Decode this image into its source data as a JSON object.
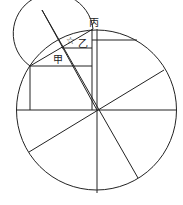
{
  "diagram": {
    "labels": {
      "bing": "丙",
      "yi": "乙",
      "jia": "甲",
      "star": "☆"
    },
    "stroke_color": "#222222",
    "background": "#ffffff"
  }
}
